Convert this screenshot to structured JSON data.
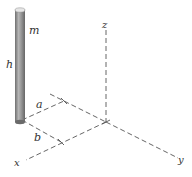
{
  "diagram": {
    "title": "",
    "labels": {
      "mass": "m",
      "height": "h",
      "dist_a": "a",
      "dist_b": "b",
      "axis_x": "x",
      "axis_y": "y",
      "axis_z": "z"
    },
    "colors": {
      "axis": "#555555",
      "rod_light": "#d8d8d8",
      "rod_mid": "#9a9a9a",
      "rod_dark": "#6a6a6a",
      "text": "#333333"
    }
  }
}
